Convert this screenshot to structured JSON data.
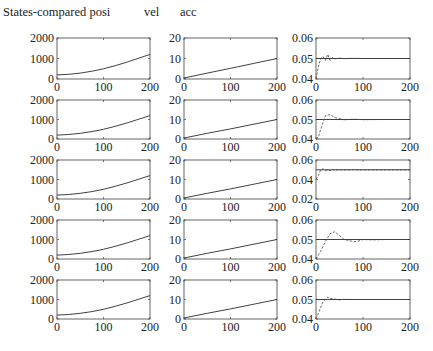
{
  "header": {
    "title": "States-compared posi",
    "col2_label": "vel",
    "col3_label": "acc"
  },
  "chart_data": {
    "type": "line",
    "layout": {
      "rows": 5,
      "cols": 3,
      "grid": false,
      "legend": "none"
    },
    "columns": [
      {
        "name": "posi",
        "ylim": [
          0,
          2000
        ],
        "yticks": [
          0,
          1000,
          2000
        ],
        "ytick_labels": [
          "0",
          "1000",
          "2000"
        ],
        "xlim": [
          0,
          200
        ],
        "xticks": [
          0,
          100,
          200
        ],
        "xtick_labels": [
          "0",
          "100",
          "200"
        ]
      },
      {
        "name": "vel",
        "ylim": [
          0,
          20
        ],
        "yticks": [
          0,
          10,
          20
        ],
        "ytick_labels": [
          "0",
          "10",
          "20"
        ],
        "xlim": [
          0,
          200
        ],
        "xticks": [
          0,
          100,
          200
        ],
        "xtick_labels": [
          "0",
          "100",
          "200"
        ]
      },
      {
        "name": "acc",
        "xlim": [
          0,
          200
        ],
        "xticks": [
          0,
          100,
          200
        ],
        "xtick_labels": [
          "0",
          "100",
          "200"
        ]
      }
    ],
    "acc_axes_per_row": [
      {
        "ylim": [
          0.04,
          0.06
        ],
        "yticks": [
          0.04,
          0.05,
          0.06
        ],
        "ytick_labels": [
          "0.04",
          "0.05",
          "0.06"
        ]
      },
      {
        "ylim": [
          0.04,
          0.06
        ],
        "yticks": [
          0.04,
          0.05,
          0.06
        ],
        "ytick_labels": [
          "0.04",
          "0.05",
          "0.06"
        ]
      },
      {
        "ylim": [
          0.02,
          0.06
        ],
        "yticks": [
          0.02,
          0.04,
          0.06
        ],
        "ytick_labels": [
          "0.02",
          "0.04",
          "0.06"
        ]
      },
      {
        "ylim": [
          0.04,
          0.06
        ],
        "yticks": [
          0.04,
          0.05,
          0.06
        ],
        "ytick_labels": [
          "0.04",
          "0.05",
          "0.06"
        ]
      },
      {
        "ylim": [
          0.04,
          0.06
        ],
        "yticks": [
          0.04,
          0.05,
          0.06
        ],
        "ytick_labels": [
          "0.04",
          "0.05",
          "0.06"
        ]
      }
    ],
    "series": [
      {
        "name": "posi",
        "x": [
          0,
          25,
          50,
          75,
          100,
          125,
          150,
          175,
          200
        ],
        "values": [
          200,
          230,
          290,
          380,
          500,
          650,
          820,
          1010,
          1200
        ]
      },
      {
        "name": "vel",
        "x": [
          0,
          50,
          100,
          150,
          200
        ],
        "values": [
          0.5,
          2.9,
          5.2,
          7.6,
          10
        ]
      },
      {
        "name": "acc_reference",
        "x": [
          0,
          200
        ],
        "values": [
          0.05,
          0.05
        ]
      },
      {
        "name": "acc_row1",
        "x": [
          0,
          5,
          10,
          15,
          20,
          25,
          30,
          35,
          40,
          50,
          60,
          80,
          100,
          150,
          200
        ],
        "values": [
          0.04,
          0.046,
          0.05,
          0.051,
          0.049,
          0.052,
          0.049,
          0.0505,
          0.0498,
          0.0502,
          0.0499,
          0.0501,
          0.05,
          0.05,
          0.05
        ]
      },
      {
        "name": "acc_row2",
        "x": [
          0,
          5,
          10,
          20,
          30,
          40,
          50,
          60,
          80,
          100,
          150,
          200
        ],
        "values": [
          0.04,
          0.041,
          0.045,
          0.052,
          0.0525,
          0.051,
          0.0505,
          0.0498,
          0.0502,
          0.0499,
          0.05,
          0.05
        ]
      },
      {
        "name": "acc_row3",
        "x": [
          0,
          5,
          10,
          15,
          20,
          25,
          30,
          35,
          40,
          50,
          60,
          80,
          100,
          150,
          200
        ],
        "values": [
          0.04,
          0.044,
          0.05,
          0.051,
          0.049,
          0.05,
          0.049,
          0.0505,
          0.0495,
          0.0503,
          0.0498,
          0.0502,
          0.05,
          0.05,
          0.05
        ]
      },
      {
        "name": "acc_row4",
        "x": [
          0,
          10,
          20,
          30,
          40,
          50,
          60,
          70,
          80,
          90,
          100,
          120,
          150,
          200
        ],
        "values": [
          0.04,
          0.044,
          0.049,
          0.053,
          0.054,
          0.052,
          0.05,
          0.0495,
          0.0488,
          0.0492,
          0.05,
          0.0498,
          0.05,
          0.05
        ]
      },
      {
        "name": "acc_row5",
        "x": [
          0,
          5,
          10,
          15,
          20,
          25,
          30,
          40,
          50,
          60,
          80,
          100,
          150,
          200
        ],
        "values": [
          0.04,
          0.043,
          0.046,
          0.049,
          0.05,
          0.0512,
          0.0505,
          0.0502,
          0.0498,
          0.0501,
          0.05,
          0.05,
          0.05,
          0.05
        ]
      }
    ]
  },
  "style": {
    "line_color": "#2b2b2b",
    "axis_color": "#555555",
    "dash_color": "#444444"
  }
}
